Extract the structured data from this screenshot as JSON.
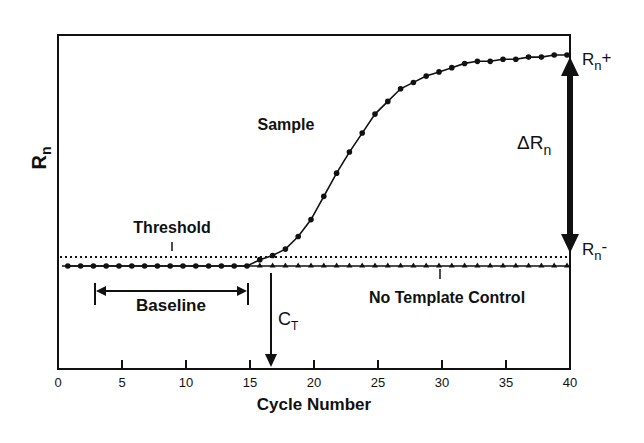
{
  "chart_data": {
    "type": "line",
    "title": "",
    "xlabel": "Cycle Number",
    "ylabel": "Rn",
    "xlim": [
      0,
      40
    ],
    "ylim_note": "arbitrary units; values normalized so baseline = 0 and plateau (Rn+) = 1.0",
    "x_ticks": [
      0,
      5,
      10,
      15,
      20,
      25,
      30,
      35,
      40
    ],
    "y_ticks": [],
    "grid": false,
    "legend": null,
    "series": [
      {
        "name": "Sample",
        "marker": "circle",
        "x": [
          1,
          2,
          3,
          4,
          5,
          6,
          7,
          8,
          9,
          10,
          11,
          12,
          13,
          14,
          15,
          16,
          17,
          18,
          19,
          20,
          21,
          22,
          23,
          24,
          25,
          26,
          27,
          28,
          29,
          30,
          31,
          32,
          33,
          34,
          35,
          36,
          37,
          38,
          39,
          40
        ],
        "values": [
          0,
          0,
          0,
          0,
          0,
          0,
          0,
          0,
          0,
          0,
          0,
          0,
          0,
          0,
          0,
          0.03,
          0.05,
          0.08,
          0.14,
          0.22,
          0.33,
          0.44,
          0.54,
          0.63,
          0.72,
          0.78,
          0.84,
          0.87,
          0.9,
          0.92,
          0.94,
          0.96,
          0.97,
          0.97,
          0.98,
          0.98,
          0.99,
          0.99,
          1.0,
          1.0
        ]
      },
      {
        "name": "No Template Control",
        "marker": "triangle",
        "x": [
          1,
          2,
          3,
          4,
          5,
          6,
          7,
          8,
          9,
          10,
          11,
          12,
          13,
          14,
          15,
          16,
          17,
          18,
          19,
          20,
          21,
          22,
          23,
          24,
          25,
          26,
          27,
          28,
          29,
          30,
          31,
          32,
          33,
          34,
          35,
          36,
          37,
          38,
          39,
          40
        ],
        "values": [
          0,
          0,
          0,
          0,
          0,
          0,
          0,
          0,
          0,
          0,
          0,
          0,
          0,
          0,
          0,
          0,
          0,
          0,
          0,
          0,
          0,
          0,
          0,
          0,
          0,
          0,
          0,
          0,
          0,
          0,
          0,
          0,
          0,
          0,
          0,
          0,
          0,
          0,
          0,
          0
        ]
      }
    ],
    "threshold": {
      "label": "Threshold",
      "value": 0.045,
      "style": "dotted"
    },
    "baseline": {
      "label": "Baseline",
      "x_range": [
        3,
        15
      ]
    },
    "ct": {
      "label": "C",
      "subscript": "T",
      "x": 16.6
    },
    "delta_rn": {
      "label": "ΔR",
      "subscript": "n",
      "from_label": "Rn-",
      "to_label": "Rn+"
    },
    "annotations": [
      "Sample",
      "Threshold",
      "Baseline",
      "No Template Control",
      "CT",
      "ΔRn",
      "Rn+",
      "Rn-"
    ]
  },
  "labels": {
    "y_axis_main": "R",
    "y_axis_sub": "n",
    "x_axis": "Cycle Number",
    "sample": "Sample",
    "threshold": "Threshold",
    "baseline": "Baseline",
    "ntc": "No Template Control",
    "ct_main": "C",
    "ct_sub": "T",
    "delta_main": "ΔR",
    "delta_sub": "n",
    "rn_plus_main": "R",
    "rn_plus_sub": "n",
    "rn_plus_sign": "+",
    "rn_minus_main": "R",
    "rn_minus_sub": "n",
    "rn_minus_sign": "-",
    "ticks": [
      "0",
      "5",
      "10",
      "15",
      "20",
      "25",
      "30",
      "35",
      "40"
    ]
  },
  "colors": {
    "ink": "#111111",
    "background": "#ffffff"
  }
}
